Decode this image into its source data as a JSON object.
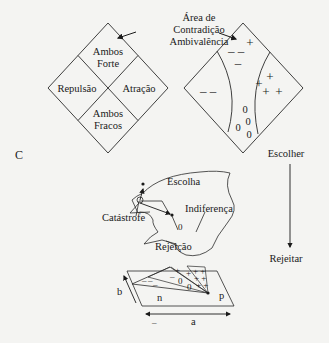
{
  "figure": {
    "panel_label": "C",
    "left_diamond": {
      "quadrants": {
        "top_line1": "Ambos",
        "top_line2": "Forte",
        "left": "Repulsão",
        "right": "Atração",
        "bottom_line1": "Ambos",
        "bottom_line2": "Fracos"
      }
    },
    "ambivalence_label": {
      "line1": "Área de",
      "line2": "Contradição",
      "line3": "Ambivalência"
    },
    "right_diamond": {
      "symbols": {
        "top_plus": "+",
        "upper_minus_pair": "– –",
        "upper_minus_single": "–",
        "left_minus_pair": "– –",
        "right_plus_1": "+",
        "right_plus_2": "+",
        "right_plus_3": "+",
        "right_plus_4": "+",
        "zero_1": "0",
        "zero_2": "0",
        "zero_3": "0",
        "zero_4": "0"
      }
    },
    "cusp_surface": {
      "labels": {
        "choice": "Escolha",
        "indifference": "Indiferença",
        "catastrophe": "Catástrofe",
        "rejection": "Rejeição",
        "small_zero": "0"
      },
      "base_plane": {
        "axis_a": "a",
        "axis_b": "b",
        "region_n": "n",
        "region_p": "p",
        "axis_a_minus": "–",
        "symbols": {
          "minus_1": "–",
          "minus_2": "–",
          "minus_3": "–",
          "minus_4": "–",
          "plus_1": "+",
          "plus_2": "+",
          "zero_1": "0",
          "zero_2": "0",
          "plus_grid": "+ +",
          "plus_grid_2": "+ +",
          "plus_grid_3": "+ +"
        }
      }
    },
    "decision_axis": {
      "top_label": "Escolher",
      "bottom_label": "Rejeitar"
    }
  }
}
